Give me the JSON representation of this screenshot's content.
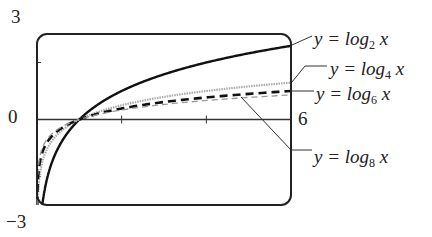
{
  "chart_data": {
    "type": "line",
    "title": "",
    "xlabel": "",
    "ylabel": "",
    "xlim": [
      0,
      6
    ],
    "ylim": [
      -3,
      3
    ],
    "x_tick_labels": [
      "0",
      "6"
    ],
    "y_tick_labels": [
      "3",
      "0",
      "-3"
    ],
    "grid": false,
    "series": [
      {
        "name": "y = log2 x",
        "base": 2,
        "style": "solid-thick",
        "x": [
          0.125,
          0.5,
          1,
          2,
          3,
          4,
          5,
          6
        ],
        "y": [
          -3,
          -1,
          0,
          1,
          1.585,
          2,
          2.322,
          2.585
        ]
      },
      {
        "name": "y = log4 x",
        "base": 4,
        "style": "dotted-gray",
        "x": [
          0.016,
          0.5,
          1,
          2,
          3,
          4,
          5,
          6
        ],
        "y": [
          -3,
          -0.5,
          0,
          0.5,
          0.792,
          1,
          1.161,
          1.292
        ]
      },
      {
        "name": "y = log6 x",
        "base": 6,
        "style": "dashed-thick",
        "x": [
          0.005,
          0.5,
          1,
          2,
          3,
          4,
          5,
          6
        ],
        "y": [
          -3,
          -0.387,
          0,
          0.387,
          0.613,
          0.774,
          0.898,
          1
        ]
      },
      {
        "name": "y = log8 x",
        "base": 8,
        "style": "dashed-thin-gray",
        "x": [
          0.002,
          0.5,
          1,
          2,
          3,
          4,
          5,
          6
        ],
        "y": [
          -3,
          -0.333,
          0,
          0.333,
          0.528,
          0.667,
          0.774,
          0.862
        ]
      }
    ]
  },
  "labels": {
    "y_top": "3",
    "y_zero": "0",
    "y_bottom": "−3",
    "x_max": "6",
    "log2": {
      "pre": "y = log",
      "sub": "2",
      "post": " x"
    },
    "log4": {
      "pre": "y = log",
      "sub": "4",
      "post": " x"
    },
    "log6": {
      "pre": "y = log",
      "sub": "6",
      "post": " x"
    },
    "log8": {
      "pre": "y = log",
      "sub": "8",
      "post": " x"
    }
  }
}
